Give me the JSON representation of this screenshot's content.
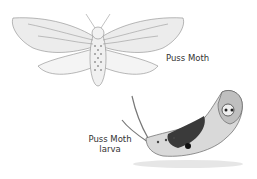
{
  "labels": {
    "moth": "Puss Moth",
    "larva_line1": "Puss Moth",
    "larva_line2": "larva"
  },
  "illustrations": {
    "moth": "puss-moth-adult",
    "larva": "puss-moth-larva"
  }
}
